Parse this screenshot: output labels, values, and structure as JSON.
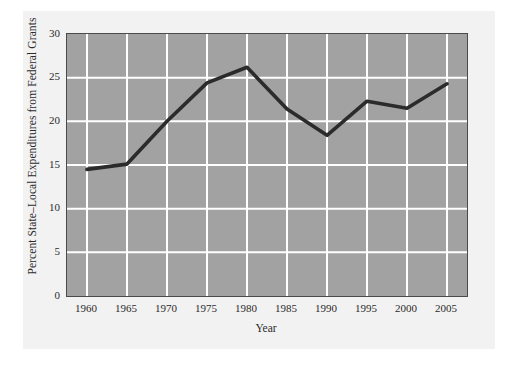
{
  "chart_data": {
    "type": "line",
    "title": "",
    "xlabel": "Year",
    "ylabel": "Percent State–Local Expenditures from Federal Grants",
    "x": [
      1960,
      1965,
      1970,
      1975,
      1980,
      1985,
      1990,
      1995,
      2000,
      2005
    ],
    "values": [
      14.5,
      15.1,
      20.0,
      24.4,
      26.2,
      21.4,
      18.4,
      22.3,
      21.5,
      24.3
    ],
    "series": [
      {
        "name": "Percent State–Local Expenditures from Federal Grants",
        "values": [
          14.5,
          15.1,
          20.0,
          24.4,
          26.2,
          21.4,
          18.4,
          22.3,
          21.5,
          24.3
        ]
      }
    ],
    "xtick_labels": [
      "1960",
      "1965",
      "1970",
      "1975",
      "1980",
      "1985",
      "1990",
      "1995",
      "2000",
      "2005"
    ],
    "ytick_labels": [
      "0",
      "5",
      "10",
      "15",
      "20",
      "25",
      "30"
    ],
    "ytick_values": [
      0,
      5,
      10,
      15,
      20,
      25,
      30
    ],
    "xlim": [
      1957.5,
      2007.5
    ],
    "ylim": [
      0,
      30
    ],
    "grid": true,
    "legend": "none",
    "colors": {
      "plot_background": "#a2a2a2",
      "figure_background": "#f2f2f2",
      "page_background": "#ffffff",
      "gridline": "#ffffff",
      "line": "#2b2b2b",
      "axis_frame": "#4a4a4a",
      "text": "#2b2b2b"
    }
  }
}
